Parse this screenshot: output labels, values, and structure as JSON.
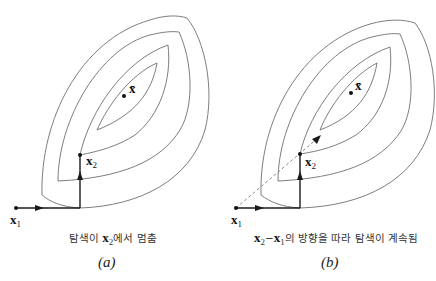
{
  "panels": [
    {
      "id": "a",
      "label": "(a)",
      "caption_prefix": "탐색이 ",
      "caption_vec": "x",
      "caption_vec_sub": "2",
      "caption_suffix": "에서 멈춤",
      "points": {
        "x1": {
          "label": "x",
          "sub": "1"
        },
        "x2": {
          "label": "x",
          "sub": "2"
        },
        "xbar": {
          "label": "x̄"
        }
      }
    },
    {
      "id": "b",
      "label": "(b)",
      "caption_vec1": "x",
      "caption_vec1_sub": "2",
      "caption_minus": "−",
      "caption_vec2": "x",
      "caption_vec2_sub": "1",
      "caption_suffix": "의 방향을 따라 탐색이 계속됨",
      "points": {
        "x1": {
          "label": "x",
          "sub": "1"
        },
        "x2": {
          "label": "x",
          "sub": "2"
        },
        "xbar": {
          "label": "x̄"
        }
      }
    }
  ],
  "colors": {
    "contour": "#6e6e6e",
    "path": "#1a1a1a",
    "dashed": "#8a8a8a"
  }
}
